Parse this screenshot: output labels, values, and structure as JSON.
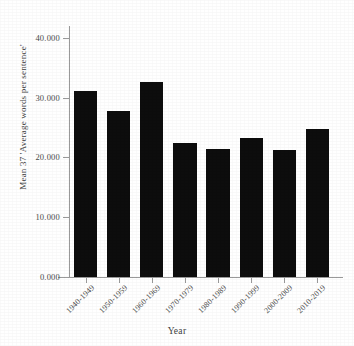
{
  "chart_data": {
    "type": "bar",
    "title": "",
    "xlabel": "Year",
    "ylabel": "Mean 37 'Average words per sentence'",
    "categories": [
      "1940-1949",
      "1950-1959",
      "1960-1969",
      "1970-1979",
      "1980-1989",
      "1990-1999",
      "2000-2009",
      "2010-2019"
    ],
    "values": [
      31.2,
      27.8,
      32.7,
      22.5,
      21.4,
      23.3,
      21.3,
      24.7
    ],
    "ylim": [
      0,
      42
    ],
    "ytick_values": [
      0,
      10,
      20,
      30,
      40
    ],
    "ytick_labels": [
      "0.000",
      "10.000",
      "20.000",
      "30.000",
      "40.000"
    ],
    "grid": false,
    "legend": "none",
    "bar_color": "#0d0d0d",
    "axis_color": "#9a9a9a",
    "text_color": "#3f3f3f"
  },
  "figure": {
    "clipped_top_text": ""
  }
}
